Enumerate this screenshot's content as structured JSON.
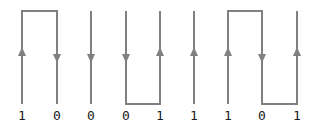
{
  "diagram": {
    "canvas": {
      "width": 318,
      "height": 129
    },
    "colors": {
      "background": "#ffffff",
      "signal_line": "#808080",
      "arrow": "#808080",
      "label_text": "#1a1a1a"
    },
    "geometry": {
      "high_level_y": 11,
      "low_level_y": 104,
      "arrow_center_y": 55,
      "transition_x": [
        22,
        57,
        91,
        126,
        160,
        194,
        228,
        262,
        297
      ],
      "stroke_width": 2
    },
    "bits": [
      {
        "value": "1",
        "x": 22,
        "arrow": "up"
      },
      {
        "value": "0",
        "x": 57,
        "arrow": "down"
      },
      {
        "value": "0",
        "x": 91,
        "arrow": "down"
      },
      {
        "value": "0",
        "x": 126,
        "arrow": "down"
      },
      {
        "value": "1",
        "x": 160,
        "arrow": "up"
      },
      {
        "value": "1",
        "x": 194,
        "arrow": "up"
      },
      {
        "value": "1",
        "x": 228,
        "arrow": "up"
      },
      {
        "value": "0",
        "x": 262,
        "arrow": "down"
      },
      {
        "value": "1",
        "x": 297,
        "arrow": "up"
      }
    ],
    "segments": {
      "high_plateaus": [
        {
          "x1": 22,
          "x2": 57
        },
        {
          "x1": 228,
          "x2": 262
        }
      ],
      "low_plateaus": [
        {
          "x1": 126,
          "x2": 160
        },
        {
          "x1": 262,
          "x2": 297
        }
      ]
    },
    "bit_string": "100011101"
  }
}
